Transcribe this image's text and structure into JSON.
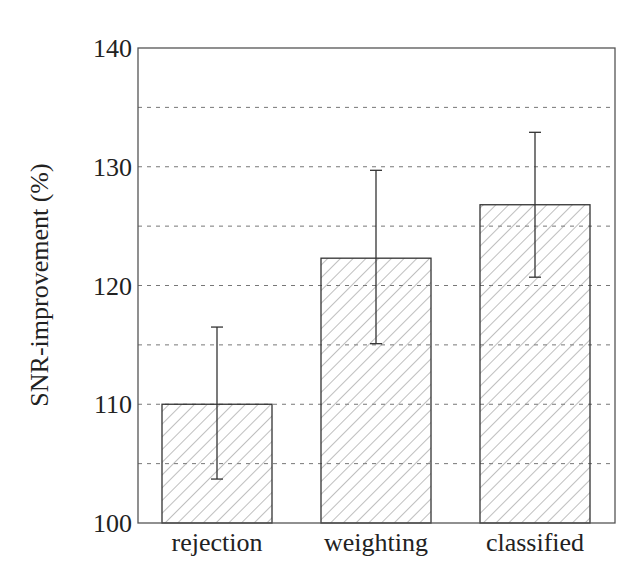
{
  "chart_data": {
    "type": "bar",
    "title": "",
    "xlabel": "",
    "ylabel": "SNR-improvement (%)",
    "categories": [
      "rejection",
      "weighting",
      "classified"
    ],
    "values": [
      110.0,
      122.3,
      126.8
    ],
    "error_bars": {
      "upper": [
        116.5,
        129.7,
        132.9
      ],
      "lower": [
        103.7,
        115.1,
        120.7
      ]
    },
    "ylim": [
      100,
      140
    ],
    "yticks": [
      100,
      110,
      120,
      130,
      140
    ],
    "grid": {
      "on": true,
      "axis": "y",
      "style": "dashed",
      "lines": [
        105,
        110,
        115,
        120,
        125,
        130,
        135
      ]
    },
    "bar_fill": "diagonal-hatch",
    "legend": null
  },
  "axis": {
    "ytick_labels": [
      "100",
      "110",
      "120",
      "130",
      "140"
    ]
  },
  "colors": {
    "frame": "#555555",
    "bar_edge": "#333333",
    "hatch": "#888888",
    "grid": "#777777",
    "text": "#222222"
  }
}
